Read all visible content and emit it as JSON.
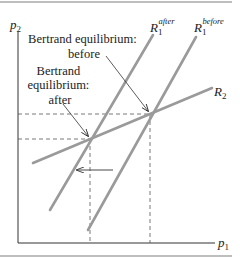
{
  "figure": {
    "axes": {
      "y_label": "p",
      "y_label_sub": "2",
      "x_label": "p",
      "x_label_sub": "1"
    },
    "curves": {
      "r1_after": {
        "name": "R",
        "sub": "1",
        "sup": "after"
      },
      "r1_before": {
        "name": "R",
        "sub": "1",
        "sup": "before"
      },
      "r2": {
        "name": "R",
        "sub": "2"
      }
    },
    "annotations": {
      "before_line1": "Bertrand equilibrium:",
      "before_line2": "before",
      "after_line1": "Bertrand",
      "after_line2": "equilibrium:",
      "after_line3": "after"
    },
    "colors": {
      "curve": "#9a9a9a",
      "axis": "#333333",
      "border": "#a8a8a8",
      "text": "#222222"
    }
  }
}
